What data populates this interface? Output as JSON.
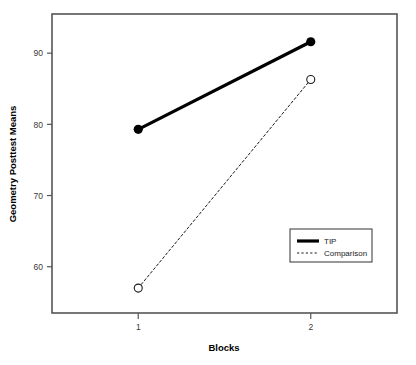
{
  "chart_data": {
    "type": "line",
    "title": "",
    "subtitle": "",
    "xlabel": "Blocks",
    "ylabel": "Geometry Posttest Means",
    "categories": [
      "1",
      "2"
    ],
    "x": [
      1,
      2
    ],
    "xlim": [
      0.5,
      2.5
    ],
    "ylim": [
      53.5,
      95.5
    ],
    "yticks": [
      60,
      70,
      80,
      90
    ],
    "ytick_labels": [
      "60",
      "70",
      "80",
      "90"
    ],
    "xticks": [
      1,
      2
    ],
    "xtick_labels": [
      "1",
      "2"
    ],
    "grid": false,
    "legend_position": "lower-right-inside",
    "series": [
      {
        "name": "TIP",
        "values": [
          79.3,
          91.6
        ],
        "line_style": "solid",
        "line_width": 3.2,
        "marker": "filled-circle",
        "color": "#000000"
      },
      {
        "name": "Comparison",
        "values": [
          57.0,
          86.3
        ],
        "line_style": "dotted",
        "line_width": 1.0,
        "marker": "open-circle",
        "color": "#1a1a1a"
      }
    ],
    "legend_entries": [
      {
        "label": "TIP",
        "line_style": "solid",
        "line_width": 3.2
      },
      {
        "label": "Comparison",
        "line_style": "dotted",
        "line_width": 1.0
      }
    ],
    "annotations": []
  },
  "axes": {
    "y_title": "Geometry Posttest Means",
    "x_title": "Blocks",
    "y_tick_0": "60",
    "y_tick_1": "70",
    "y_tick_2": "80",
    "y_tick_3": "90",
    "x_tick_0": "1",
    "x_tick_1": "2"
  },
  "legend": {
    "entry_0_label": "TIP",
    "entry_1_label": "Comparison"
  },
  "style": {
    "frame_color": "#555555",
    "plot_background": "#ffffff",
    "page_background": "#ffffff",
    "series_tip_color": "#000000",
    "series_comparison_color": "#1a1a1a"
  }
}
